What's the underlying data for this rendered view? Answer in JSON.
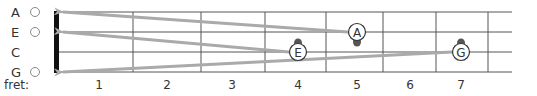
{
  "strings": [
    {
      "name": "A",
      "y": 12,
      "open": true
    },
    {
      "name": "E",
      "y": 32,
      "open": true
    },
    {
      "name": "C",
      "y": 52,
      "open": false
    },
    {
      "name": "G",
      "y": 72,
      "open": true
    }
  ],
  "fret_label": "fret:",
  "frets": [
    "1",
    "2",
    "3",
    "4",
    "5",
    "6",
    "7"
  ],
  "fret_x": [
    57,
    133,
    201,
    265,
    326,
    383,
    436,
    488
  ],
  "fret_label_x": [
    99,
    167,
    232,
    298,
    357,
    410,
    461
  ],
  "string_end_x": 512,
  "notes": [
    {
      "label": "A",
      "x": 357,
      "y": 32,
      "string": "E",
      "fret": 5
    },
    {
      "label": "E",
      "x": 298,
      "y": 52,
      "string": "C",
      "fret": 4
    },
    {
      "label": "G",
      "x": 461,
      "y": 52,
      "string": "C",
      "fret": 7
    }
  ],
  "arrows": [
    {
      "from": "A",
      "to_string": "A"
    },
    {
      "from": "E",
      "to_string": "E"
    },
    {
      "from": "G",
      "to_string": "G"
    }
  ],
  "colors": {
    "line": "#555555",
    "nut": "#111111",
    "arrow": "#aaaaaa",
    "text": "#333333"
  }
}
